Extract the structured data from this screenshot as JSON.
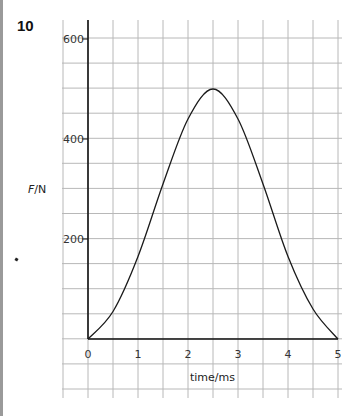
{
  "question": {
    "number": "10"
  },
  "chart_data": {
    "type": "line",
    "title": "",
    "xlabel": "time/ms",
    "ylabel": "F/N",
    "xlim": [
      0,
      5
    ],
    "ylim": [
      0,
      600
    ],
    "x_ticks": [
      "0",
      "1",
      "2",
      "3",
      "4",
      "5"
    ],
    "y_ticks": [
      "200",
      "400",
      "600"
    ],
    "grid": true,
    "grid_minor_x": 0.5,
    "grid_minor_y": 50,
    "legend": null,
    "series": [
      {
        "name": "F",
        "x": [
          0,
          0.5,
          1.0,
          1.5,
          2.0,
          2.5,
          3.0,
          3.5,
          4.0,
          4.5,
          5.0
        ],
        "values": [
          0,
          55,
          165,
          310,
          440,
          500,
          440,
          310,
          165,
          60,
          0
        ]
      }
    ],
    "annotations": []
  },
  "colors": {
    "grid": "#b8b8b8",
    "axis": "#111111",
    "curve": "#1a1a1a"
  }
}
